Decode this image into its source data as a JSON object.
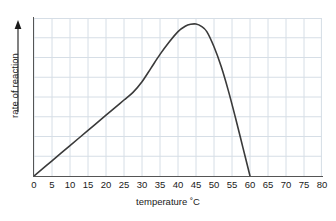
{
  "chart_data": {
    "type": "line",
    "title": "",
    "subtitle": "",
    "xlabel": "temperature ˚C",
    "ylabel": "rate of reaction",
    "xlim": [
      0,
      80
    ],
    "ylim": [
      0,
      1
    ],
    "grid": true,
    "grid_color": "#d6dee6",
    "legend": "none",
    "axis_color": "#555555",
    "line_color": "#3a3a3a",
    "xticks": [
      0,
      5,
      10,
      15,
      20,
      25,
      30,
      35,
      40,
      45,
      50,
      55,
      60,
      65,
      70,
      75,
      80
    ],
    "xticklabels": [
      "0",
      "5",
      "10",
      "15",
      "20",
      "25",
      "30",
      "35",
      "40",
      "45",
      "50",
      "55",
      "60",
      "65",
      "70",
      "75",
      "80"
    ],
    "yticks": [],
    "yticklabels": [],
    "y_axis_arrow": true,
    "x": [
      0,
      5,
      10,
      15,
      20,
      22.5,
      25,
      27.5,
      30,
      32.5,
      35,
      37.5,
      40,
      42,
      43.5,
      45,
      46.5,
      48,
      50,
      52,
      54,
      56,
      58,
      60
    ],
    "values": [
      0.0,
      0.1,
      0.2,
      0.3,
      0.4,
      0.45,
      0.5,
      0.55,
      0.62,
      0.71,
      0.8,
      0.88,
      0.95,
      0.985,
      0.998,
      1.0,
      0.985,
      0.95,
      0.85,
      0.72,
      0.56,
      0.38,
      0.19,
      0.0
    ],
    "annotations": []
  },
  "axes": {
    "x_title": "temperature ˚C",
    "y_title": "rate of reaction"
  }
}
